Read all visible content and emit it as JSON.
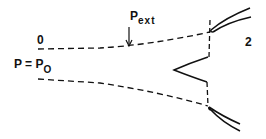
{
  "diagram": {
    "labels": {
      "station_0": "0",
      "station_2": "2",
      "pressure_eq_main": "P = P",
      "pressure_eq_sub": "O",
      "pext_main": "P",
      "pext_sub": "ext"
    },
    "colors": {
      "ink": "#111111",
      "background": "#ffffff"
    }
  }
}
